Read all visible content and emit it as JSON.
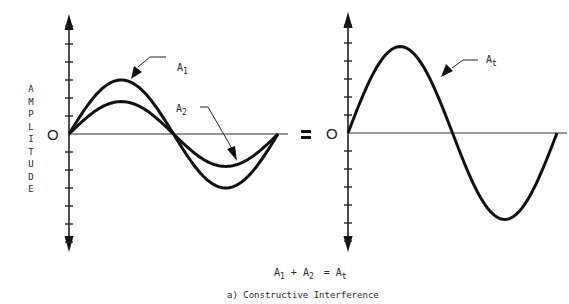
{
  "figure": {
    "caption": "a) Constructive Interference",
    "equation": {
      "term1": "A",
      "term1_sub": "1",
      "plus": "+",
      "term2": "A",
      "term2_sub": "2",
      "equals": "=",
      "result": "A",
      "result_sub": "t"
    },
    "y_axis_label_letters": [
      "A",
      "M",
      "P",
      "L",
      "I",
      "T",
      "U",
      "D",
      "E"
    ],
    "origin_label": "O",
    "equals_sign": "="
  },
  "chart_data": [
    {
      "type": "line",
      "panel": "left",
      "title": "",
      "xlabel": "",
      "ylabel": "AMPLITUDE",
      "x_range_periods": [
        0,
        1
      ],
      "ylim": [
        -7,
        7
      ],
      "ticks_per_half_axis": 6,
      "series": [
        {
          "name": "A1",
          "label": "A",
          "sub": "1",
          "function": "sine",
          "amplitude": 3.0,
          "periods": 1
        },
        {
          "name": "A2",
          "label": "A",
          "sub": "2",
          "function": "sine",
          "amplitude": 1.8,
          "periods": 1
        }
      ]
    },
    {
      "type": "line",
      "panel": "right",
      "title": "",
      "xlabel": "",
      "ylabel": "",
      "x_range_periods": [
        0,
        1
      ],
      "ylim": [
        -7,
        7
      ],
      "ticks_per_half_axis": 6,
      "series": [
        {
          "name": "At",
          "label": "A",
          "sub": "t",
          "function": "sine",
          "amplitude": 4.8,
          "periods": 1
        }
      ]
    }
  ]
}
